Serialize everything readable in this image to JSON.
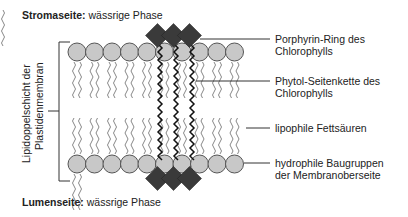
{
  "header": {
    "side_bold": "Stromaseite:",
    "side_rest": " wässrige Phase"
  },
  "footer": {
    "side_bold": "Lumenseite:",
    "side_rest": " wässrige Phase"
  },
  "vertical_label": {
    "line1": "Lipidoppelschicht der",
    "line2": "Plastidenmembran"
  },
  "labels": [
    {
      "line1": "Porphyrin-Ring des",
      "line2": "Chlorophylls"
    },
    {
      "line1": "Phytol-Seitenkette des",
      "line2": "Chlorophylls"
    },
    {
      "line1": "lipophile Fettsäuren",
      "line2": ""
    },
    {
      "line1": "hydrophile Baugruppen",
      "line2": "der Membranoberseite"
    }
  ],
  "colors": {
    "head": "#c8c8c8",
    "head_stroke": "#555555",
    "porphyrin": "#3a3a3a",
    "tail": "#888888",
    "phytol": "#111111",
    "line": "#333333"
  }
}
